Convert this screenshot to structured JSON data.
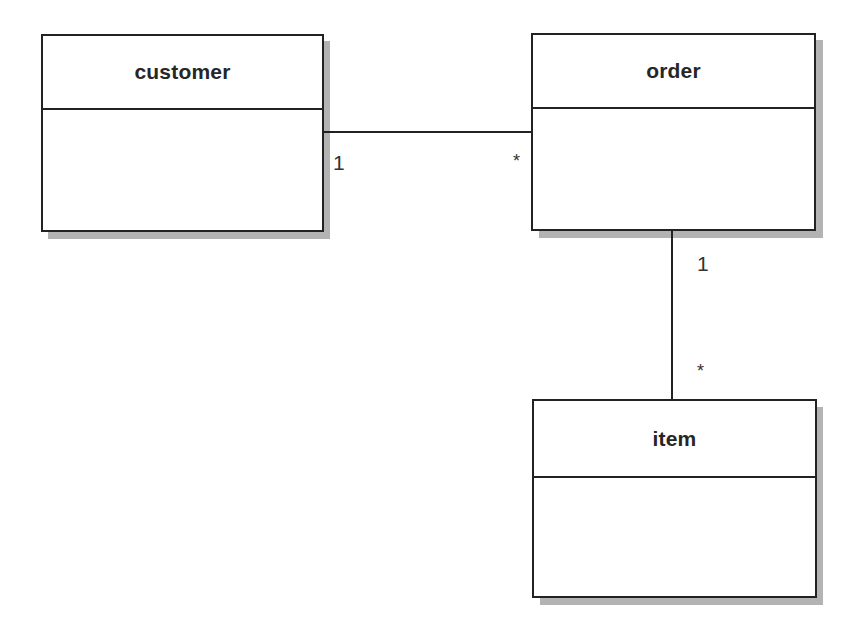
{
  "diagram": {
    "type": "uml-class-diagram",
    "classes": [
      {
        "id": "customer",
        "name": "customer",
        "attributes": []
      },
      {
        "id": "order",
        "name": "order",
        "attributes": []
      },
      {
        "id": "item",
        "name": "item",
        "attributes": []
      }
    ],
    "associations": [
      {
        "from": "customer",
        "to": "order",
        "from_multiplicity": "1",
        "to_multiplicity": "*"
      },
      {
        "from": "order",
        "to": "item",
        "from_multiplicity": "1",
        "to_multiplicity": "*"
      }
    ]
  },
  "colors": {
    "border": "#222222",
    "shadow": "#b3b3b3",
    "text": "#262626",
    "background": "#ffffff"
  }
}
